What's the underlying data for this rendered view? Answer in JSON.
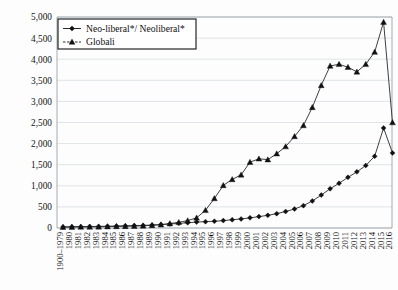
{
  "chart_data": {
    "type": "line",
    "title": "",
    "subtitle": "",
    "xlabel": "",
    "ylabel": "",
    "ylim": [
      0,
      5000
    ],
    "ytick_step": 500,
    "grid": true,
    "legend_position": "top-left",
    "ytick_labels": [
      "0",
      "500",
      "1,000",
      "1,500",
      "2,000",
      "2,500",
      "3,000",
      "3,500",
      "4,000",
      "4,500",
      "5,000"
    ],
    "categories": [
      "1900–1979",
      "1980",
      "1981",
      "1982",
      "1983",
      "1984",
      "1985",
      "1986",
      "1987",
      "1988",
      "1989",
      "1990",
      "1991",
      "1992",
      "1993",
      "1994",
      "1995",
      "1996",
      "1997",
      "1998",
      "1999",
      "2000",
      "2001",
      "2002",
      "2003",
      "2004",
      "2005",
      "2006",
      "2007",
      "2008",
      "2009",
      "2010",
      "2011",
      "2012",
      "2013",
      "2014",
      "2015",
      "2016"
    ],
    "series": [
      {
        "name": "Neo-liberal*/ Neoliberal*",
        "marker": "diamond",
        "color": "#111111",
        "values": [
          25,
          30,
          32,
          35,
          38,
          42,
          48,
          52,
          58,
          62,
          70,
          80,
          95,
          110,
          125,
          140,
          150,
          160,
          175,
          195,
          215,
          240,
          270,
          300,
          340,
          390,
          450,
          530,
          640,
          780,
          930,
          1060,
          1200,
          1330,
          1480,
          1700,
          2370,
          1780
        ]
      },
      {
        "name": "Globali",
        "marker": "triangle",
        "color": "#111111",
        "values": [
          20,
          22,
          24,
          26,
          28,
          32,
          36,
          40,
          46,
          52,
          62,
          80,
          105,
          135,
          175,
          240,
          420,
          700,
          1010,
          1150,
          1260,
          1560,
          1640,
          1620,
          1760,
          1930,
          2170,
          2430,
          2860,
          3380,
          3840,
          3880,
          3810,
          3700,
          3880,
          4170,
          4880,
          2500
        ]
      }
    ],
    "legend_entries": [
      {
        "label": "Neo-liberal*/ Neoliberal*",
        "marker": "diamond"
      },
      {
        "label": "Globali",
        "marker": "triangle"
      }
    ]
  }
}
